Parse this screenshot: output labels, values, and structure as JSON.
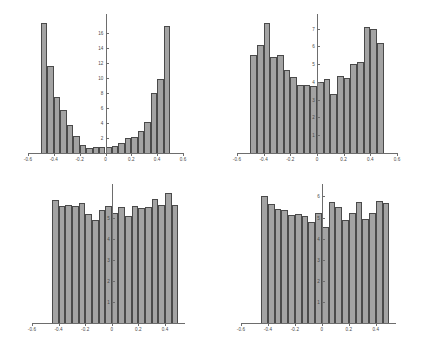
{
  "figure": {
    "background": "#ffffff",
    "bar_fill": "#a3a3a3",
    "bar_edge": "#4a4a4a",
    "axis_color": "#6d6d6d",
    "panel_count": 4
  },
  "chart_data": [
    {
      "id": "panel-top-left",
      "type": "bar",
      "title": "",
      "xlabel": "",
      "ylabel": "",
      "grid": false,
      "legend": "none",
      "xlim": [
        -0.6,
        0.6
      ],
      "ylim": [
        0,
        18
      ],
      "xticks": [
        -0.6,
        -0.4,
        -0.2,
        0,
        0.2,
        0.4,
        0.6
      ],
      "xtick_labels": [
        "-0.6",
        "-0.4",
        "-0.2",
        "0",
        "0.2",
        "0.4",
        "0.6"
      ],
      "yticks": [
        2,
        4,
        6,
        8,
        10,
        12,
        14,
        16
      ],
      "ytick_labels": [
        "2",
        "4",
        "6",
        "8",
        "10",
        "12",
        "14",
        "16"
      ],
      "bin_edges": [
        -0.5,
        -0.45,
        -0.4,
        -0.35,
        -0.3,
        -0.25,
        -0.2,
        -0.15,
        -0.1,
        -0.05,
        0.0,
        0.05,
        0.1,
        0.15,
        0.2,
        0.25,
        0.3,
        0.35,
        0.4,
        0.45,
        0.5
      ],
      "categories": [
        "-0.50",
        "-0.45",
        "-0.40",
        "-0.35",
        "-0.30",
        "-0.25",
        "-0.20",
        "-0.15",
        "-0.10",
        "-0.05",
        "0.00",
        "0.05",
        "0.10",
        "0.15",
        "0.20",
        "0.25",
        "0.30",
        "0.35",
        "0.40",
        "0.45"
      ],
      "values": [
        17.3,
        11.6,
        7.5,
        5.7,
        3.8,
        2.3,
        1.1,
        0.7,
        0.8,
        0.8,
        0.8,
        0.9,
        1.3,
        2.0,
        2.2,
        2.9,
        4.1,
        8.0,
        9.9,
        16.9
      ]
    },
    {
      "id": "panel-top-right",
      "type": "bar",
      "title": "",
      "xlabel": "",
      "ylabel": "",
      "grid": false,
      "legend": "none",
      "xlim": [
        -0.6,
        0.6
      ],
      "ylim": [
        0,
        7.6
      ],
      "xticks": [
        -0.6,
        -0.4,
        -0.2,
        0,
        0.2,
        0.4,
        0.6
      ],
      "xtick_labels": [
        "-0.6",
        "-0.4",
        "-0.2",
        "0",
        "0.2",
        "0.4",
        "0.6"
      ],
      "yticks": [
        1,
        2,
        3,
        4,
        5,
        6,
        7
      ],
      "ytick_labels": [
        "1",
        "2",
        "3",
        "4",
        "5",
        "6",
        "7"
      ],
      "bin_edges": [
        -0.5,
        -0.45,
        -0.4,
        -0.35,
        -0.3,
        -0.25,
        -0.2,
        -0.15,
        -0.1,
        -0.05,
        0.0,
        0.05,
        0.1,
        0.15,
        0.2,
        0.25,
        0.3,
        0.35,
        0.4,
        0.45,
        0.5
      ],
      "categories": [
        "-0.50",
        "-0.45",
        "-0.40",
        "-0.35",
        "-0.30",
        "-0.25",
        "-0.20",
        "-0.15",
        "-0.10",
        "-0.05",
        "0.00",
        "0.05",
        "0.10",
        "0.15",
        "0.20",
        "0.25",
        "0.30",
        "0.35",
        "0.40",
        "0.45"
      ],
      "values": [
        5.5,
        6.1,
        7.3,
        5.4,
        5.5,
        4.7,
        4.3,
        3.85,
        3.85,
        3.75,
        4.0,
        4.15,
        3.3,
        4.35,
        4.2,
        5.0,
        5.1,
        7.1,
        7.0,
        6.2
      ]
    },
    {
      "id": "panel-bottom-left",
      "type": "bar",
      "title": "",
      "xlabel": "",
      "ylabel": "",
      "grid": false,
      "legend": "none",
      "xlim": [
        -0.6,
        0.55
      ],
      "ylim": [
        0,
        6.4
      ],
      "xticks": [
        -0.6,
        -0.4,
        -0.2,
        0,
        0.2,
        0.4
      ],
      "xtick_labels": [
        "-0.6",
        "-0.4",
        "-0.2",
        "0",
        "0.2",
        "0.4"
      ],
      "yticks": [
        1,
        2,
        3,
        4,
        5
      ],
      "ytick_labels": [
        "1",
        "2",
        "3",
        "4",
        "5"
      ],
      "bin_edges": [
        -0.45,
        -0.4,
        -0.35,
        -0.3,
        -0.25,
        -0.2,
        -0.15,
        -0.1,
        -0.05,
        0.0,
        0.05,
        0.1,
        0.15,
        0.2,
        0.25,
        0.3,
        0.35,
        0.4,
        0.45,
        0.5
      ],
      "categories": [
        "-0.45",
        "-0.40",
        "-0.35",
        "-0.30",
        "-0.25",
        "-0.20",
        "-0.15",
        "-0.10",
        "-0.05",
        "0.00",
        "0.05",
        "0.10",
        "0.15",
        "0.20",
        "0.25",
        "0.30",
        "0.35",
        "0.40",
        "0.45"
      ],
      "values": [
        5.85,
        5.55,
        5.6,
        5.55,
        5.7,
        5.15,
        4.9,
        5.35,
        5.55,
        5.2,
        5.5,
        5.05,
        5.55,
        5.45,
        5.5,
        5.9,
        5.6,
        6.15,
        5.6
      ]
    },
    {
      "id": "panel-bottom-right",
      "type": "bar",
      "title": "",
      "xlabel": "",
      "ylabel": "",
      "grid": false,
      "legend": "none",
      "xlim": [
        -0.6,
        0.55
      ],
      "ylim": [
        0,
        6.4
      ],
      "xticks": [
        -0.6,
        -0.4,
        -0.2,
        0,
        0.2,
        0.4
      ],
      "xtick_labels": [
        "-0.6",
        "-0.4",
        "-0.2",
        "0",
        "0.2",
        "0.4"
      ],
      "yticks": [
        1,
        2,
        3,
        4,
        5,
        6
      ],
      "ytick_labels": [
        "1",
        "2",
        "3",
        "4",
        "5",
        "6"
      ],
      "bin_edges": [
        -0.45,
        -0.4,
        -0.35,
        -0.3,
        -0.25,
        -0.2,
        -0.15,
        -0.1,
        -0.05,
        0.0,
        0.05,
        0.1,
        0.15,
        0.2,
        0.25,
        0.3,
        0.35,
        0.4,
        0.45,
        0.5
      ],
      "categories": [
        "-0.45",
        "-0.40",
        "-0.35",
        "-0.30",
        "-0.25",
        "-0.20",
        "-0.15",
        "-0.10",
        "-0.05",
        "0.00",
        "0.05",
        "0.10",
        "0.15",
        "0.20",
        "0.25",
        "0.30",
        "0.35",
        "0.40",
        "0.45"
      ],
      "values": [
        6.0,
        5.65,
        5.4,
        5.35,
        5.1,
        5.15,
        5.05,
        4.8,
        5.2,
        4.55,
        5.75,
        5.5,
        4.9,
        5.2,
        5.75,
        4.95,
        5.2,
        5.8,
        5.7
      ]
    }
  ]
}
